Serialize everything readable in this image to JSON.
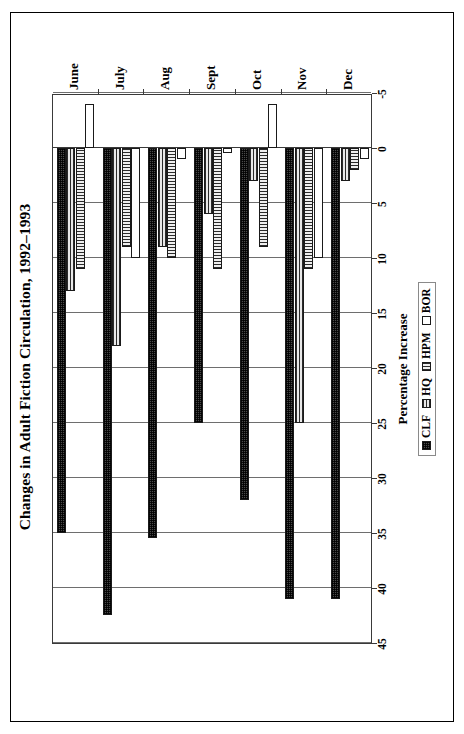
{
  "figure": {
    "title": "Changes in Adult Fiction Circulation, 1992–1993"
  },
  "legend": {
    "position": "below-plot",
    "items": [
      {
        "label": "CLF",
        "pattern": "cross-hatch-dark"
      },
      {
        "label": "HQ",
        "pattern": "horizontal-lines"
      },
      {
        "label": "HPM",
        "pattern": "vertical-lines"
      },
      {
        "label": "BOR",
        "pattern": "solid-white"
      }
    ]
  },
  "axes": {
    "value_axis_title": "Percentage Increase",
    "value_ticks": [
      "45",
      "40",
      "35",
      "30",
      "25",
      "20",
      "15",
      "10",
      "5",
      "0",
      "-5"
    ],
    "category_labels": [
      "June",
      "July",
      "Aug",
      "Sept",
      "Oct",
      "Nov",
      "Dec"
    ]
  },
  "chart_data": {
    "type": "bar",
    "orientation": "horizontal",
    "title": "Changes in Adult Fiction Circulation, 1992–1993",
    "xlabel": "",
    "ylabel": "Percentage Increase",
    "categories": [
      "June",
      "July",
      "Aug",
      "Sept",
      "Oct",
      "Nov",
      "Dec"
    ],
    "series": [
      {
        "name": "CLF",
        "values": [
          35,
          42.5,
          35.5,
          25,
          32,
          41,
          41
        ]
      },
      {
        "name": "HQ",
        "values": [
          13,
          18,
          9,
          6,
          3,
          25,
          3
        ]
      },
      {
        "name": "HPM",
        "values": [
          11,
          9,
          10,
          11,
          9,
          11,
          2
        ]
      },
      {
        "name": "BOR",
        "values": [
          -4,
          10,
          1,
          0.5,
          -4,
          10,
          1
        ]
      }
    ],
    "ylim": [
      -5,
      45
    ],
    "tick_step": 5,
    "grid": "value-axis-only",
    "legend_position": "bottom",
    "colors": {
      "CLF": "#4a4a4a",
      "HQ": "#cfcfcf",
      "HPM": "#d8d8d8",
      "BOR": "#ffffff",
      "outline": "#1a1a1a",
      "grid": "#6e6e6e",
      "frame": "#000000"
    }
  }
}
